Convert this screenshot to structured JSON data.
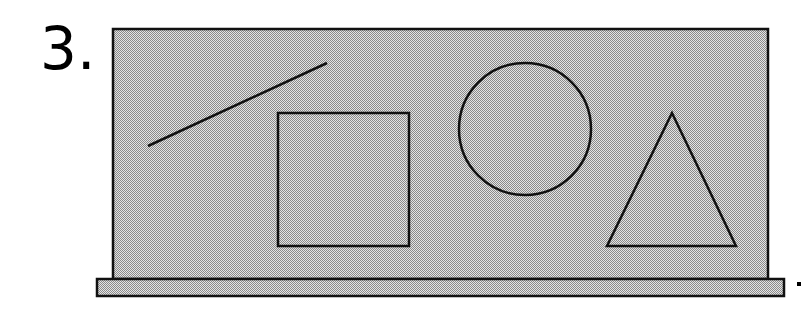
{
  "question": {
    "number_label": "3."
  },
  "colors": {
    "fill": "#c8c8c8",
    "stroke": "#111111",
    "background": "#ffffff"
  },
  "diagram": {
    "board": {
      "x": 113,
      "y": 29,
      "width": 655,
      "height": 250
    },
    "base": {
      "x": 97,
      "y": 279,
      "width": 687,
      "height": 17
    },
    "shapes": [
      {
        "type": "line",
        "name": "line-segment",
        "x1": 148,
        "y1": 146,
        "x2": 327,
        "y2": 63
      },
      {
        "type": "square",
        "name": "square",
        "x": 278,
        "y": 113,
        "width": 131,
        "height": 133
      },
      {
        "type": "circle",
        "name": "circle",
        "cx": 525,
        "cy": 129,
        "r": 66
      },
      {
        "type": "triangle",
        "name": "triangle",
        "points": "672,113 607,246 736,246"
      }
    ]
  }
}
